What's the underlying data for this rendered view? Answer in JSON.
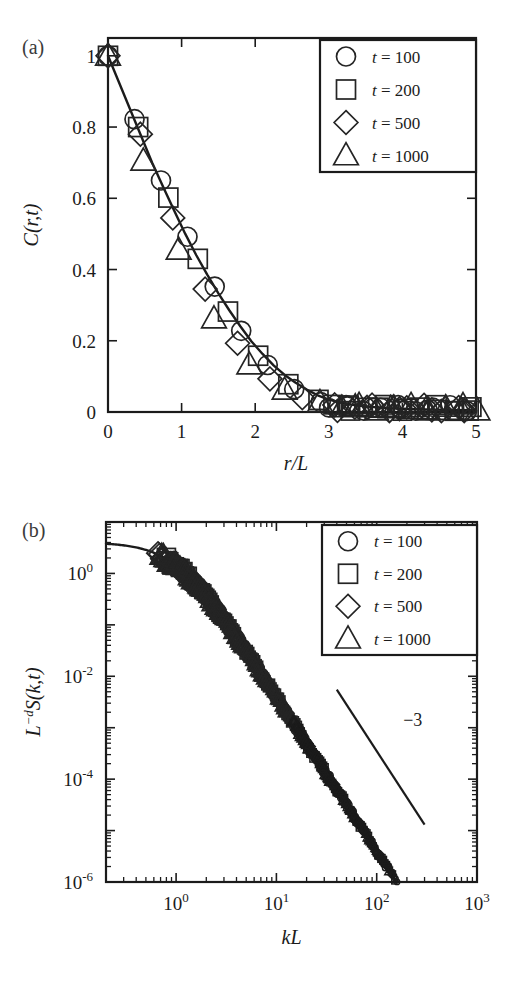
{
  "figure": {
    "background": "#ffffff",
    "ink": "#1b1b1b",
    "width": 515,
    "height": 989
  },
  "panels": [
    {
      "id": "a",
      "label": "(a)",
      "chart_data": {
        "type": "scatter",
        "title": "",
        "xlabel": "r/L",
        "ylabel": "C(r,t)",
        "xlim": [
          0,
          5
        ],
        "ylim": [
          0,
          1.05
        ],
        "xticks": [
          0,
          1,
          2,
          3,
          4,
          5
        ],
        "xticklabels": [
          "0",
          "1",
          "2",
          "3",
          "4",
          "5"
        ],
        "yticks": [
          0,
          0.2,
          0.4,
          0.6,
          0.8,
          1
        ],
        "yticklabels": [
          "0",
          "0.2",
          "0.4",
          "0.6",
          "0.8",
          "1"
        ],
        "grid": false,
        "legend_position": "upper right",
        "xscale": "linear",
        "yscale": "linear",
        "fit_curve": {
          "name": "scaling function",
          "x": [
            0,
            0.15,
            0.3,
            0.45,
            0.6,
            0.75,
            0.9,
            1.05,
            1.2,
            1.35,
            1.5,
            1.65,
            1.8,
            1.95,
            2.1,
            2.25,
            2.4,
            2.55,
            2.7,
            2.85,
            3.0,
            3.2,
            3.4,
            3.6,
            3.8,
            4.0,
            4.3,
            4.6,
            5.0
          ],
          "y": [
            1.0,
            0.925,
            0.85,
            0.775,
            0.7,
            0.632,
            0.565,
            0.5,
            0.44,
            0.385,
            0.333,
            0.285,
            0.24,
            0.198,
            0.163,
            0.131,
            0.104,
            0.082,
            0.063,
            0.047,
            0.035,
            0.024,
            0.018,
            0.014,
            0.011,
            0.009,
            0.007,
            0.006,
            0.005
          ]
        },
        "series": [
          {
            "name": "t = 100",
            "marker": "circle",
            "x": [
              0.0,
              0.36,
              0.72,
              1.08,
              1.45,
              1.81,
              2.17,
              2.53,
              2.89,
              3.25,
              3.61,
              3.98,
              4.34,
              4.7
            ],
            "y": [
              1.0,
              0.822,
              0.65,
              0.492,
              0.352,
              0.228,
              0.132,
              0.064,
              0.028,
              0.016,
              0.012,
              0.009,
              0.006,
              0.004
            ]
          },
          {
            "name": "t = 200",
            "marker": "square",
            "x": [
              0.0,
              0.41,
              0.82,
              1.22,
              1.63,
              2.04,
              2.45,
              2.86,
              3.27,
              3.67,
              4.08,
              4.49,
              4.9
            ],
            "y": [
              1.0,
              0.8,
              0.602,
              0.43,
              0.282,
              0.158,
              0.078,
              0.034,
              0.018,
              0.012,
              0.009,
              0.006,
              0.004
            ]
          },
          {
            "name": "t = 500",
            "marker": "diamond",
            "x": [
              0.0,
              0.44,
              0.88,
              1.32,
              1.76,
              2.2,
              2.64,
              3.08,
              3.52,
              3.96,
              4.4,
              4.84
            ],
            "y": [
              1.0,
              0.78,
              0.545,
              0.345,
              0.193,
              0.093,
              0.04,
              0.02,
              0.013,
              0.009,
              0.006,
              0.004
            ]
          },
          {
            "name": "t = 1000",
            "marker": "triangle",
            "x": [
              0.0,
              0.48,
              0.96,
              1.44,
              1.92,
              2.4,
              2.88,
              3.36,
              3.84,
              4.32,
              4.8,
              5.02
            ],
            "y": [
              1.0,
              0.705,
              0.455,
              0.262,
              0.133,
              0.062,
              0.027,
              0.015,
              0.01,
              0.007,
              0.005,
              0.004
            ]
          }
        ]
      },
      "legend": {
        "entries": [
          {
            "marker": "circle",
            "label": "t = 100",
            "var": "t",
            "value": "100"
          },
          {
            "marker": "square",
            "label": "t = 200",
            "var": "t",
            "value": "200"
          },
          {
            "marker": "diamond",
            "label": "t = 500",
            "var": "t",
            "value": "500"
          },
          {
            "marker": "triangle",
            "label": "t = 1000",
            "var": "t",
            "value": "1000"
          }
        ]
      }
    },
    {
      "id": "b",
      "label": "(b)",
      "chart_data": {
        "type": "scatter",
        "title": "",
        "xlabel": "kL",
        "ylabel": "L^-d S(k,t)",
        "xscale": "log",
        "yscale": "log",
        "xlim": [
          0.2,
          1000
        ],
        "ylim": [
          1e-06,
          10
        ],
        "xticks": [
          1,
          10,
          100,
          1000
        ],
        "xticklabels": [
          "10^0",
          "10^1",
          "10^2",
          "10^3"
        ],
        "yticks": [
          1e-06,
          0.0001,
          0.01,
          1
        ],
        "yticklabels": [
          "10^-6",
          "10^-4",
          "10^-2",
          "10^0"
        ],
        "grid": false,
        "legend_position": "upper right",
        "fit_curve": {
          "name": "scaling function",
          "plateau_value": 4.0,
          "knee_x": 1.0,
          "slope": -3
        },
        "series": [
          {
            "name": "t = 100",
            "marker": "circle",
            "x_start": 1.05,
            "x_end": 165,
            "amplitude": 4.0,
            "knee": 1.0,
            "slope": -3
          },
          {
            "name": "t = 200",
            "marker": "square",
            "x_start": 0.8,
            "x_end": 150,
            "amplitude": 4.0,
            "knee": 1.0,
            "slope": -3
          },
          {
            "name": "t = 500",
            "marker": "diamond",
            "x_start": 0.66,
            "x_end": 140,
            "amplitude": 4.0,
            "knee": 1.0,
            "slope": -3
          },
          {
            "name": "t = 1000",
            "marker": "triangle",
            "x_start": 0.72,
            "x_end": 130,
            "amplitude": 4.0,
            "knee": 1.0,
            "slope": -3
          }
        ],
        "annotations": [
          {
            "name": "slope-guide",
            "text": "−3",
            "slope": -3,
            "x1": 40,
            "y1": 0.0055,
            "x2": 300,
            "y2": 1.3e-05,
            "label_x": 160,
            "label_y": 0.0011
          }
        ]
      },
      "legend": {
        "entries": [
          {
            "marker": "circle",
            "label": "t = 100",
            "var": "t",
            "value": "100"
          },
          {
            "marker": "square",
            "label": "t = 200",
            "var": "t",
            "value": "200"
          },
          {
            "marker": "diamond",
            "label": "t = 500",
            "var": "t",
            "value": "500"
          },
          {
            "marker": "triangle",
            "label": "t = 1000",
            "var": "t",
            "value": "1000"
          }
        ]
      }
    }
  ]
}
